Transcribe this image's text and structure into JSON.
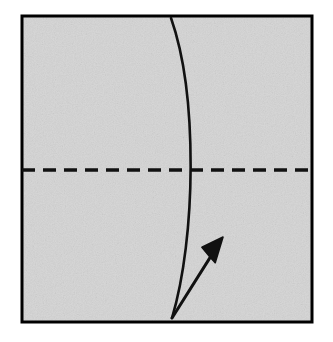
{
  "figure": {
    "background_color": "#ffffff"
  },
  "paper": {
    "name": "paper-square",
    "fill_color": "#d5d5d5",
    "stroke_color": "#000000",
    "stroke_width": 3,
    "x": 22,
    "y": 16,
    "width": 290,
    "height": 306,
    "texture": "speckled-gray-paper"
  },
  "crease_line": {
    "name": "horizontal-dashed-crease",
    "fold_type": "valley-fold",
    "orientation": "horizontal",
    "y": 170,
    "x_start": 22,
    "x_end": 312,
    "color": "#111111",
    "stroke_width": 3.4,
    "dash_length": 13,
    "gap_length": 8
  },
  "curve": {
    "name": "curved-fold-edge",
    "color": "#111111",
    "stroke_width": 2.6,
    "start": {
      "x": 171,
      "y": 18
    },
    "control_1": {
      "x": 198,
      "y": 95
    },
    "control_2": {
      "x": 196,
      "y": 238
    },
    "end": {
      "x": 172,
      "y": 318
    },
    "crossing_point": {
      "x": 195,
      "y": 170
    }
  },
  "arrow": {
    "name": "fold-direction-arrow",
    "color": "#111111",
    "stroke_width": 3,
    "tail": {
      "x": 172,
      "y": 318
    },
    "tip": {
      "x": 223,
      "y": 237
    },
    "head_length": 26,
    "head_width": 13,
    "direction": "up-right",
    "meaning": "fold edge upward to the right"
  },
  "colors": {
    "paper_gray": "#d5d5d5",
    "ink_black": "#111111",
    "page_white": "#ffffff"
  }
}
